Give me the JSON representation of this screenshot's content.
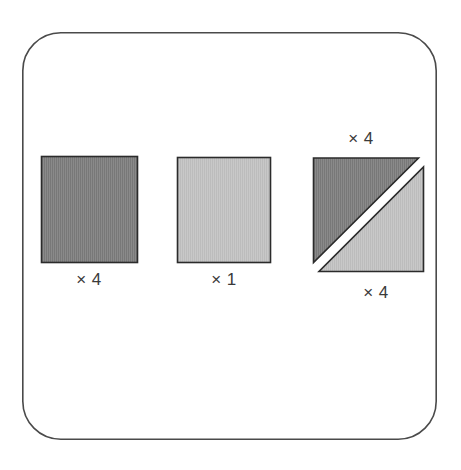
{
  "figure": {
    "canvas": {
      "width": 461,
      "height": 470,
      "background": "#ffffff"
    },
    "frame": {
      "name": "rounded-rectangle-frame",
      "x": 22,
      "y": 32,
      "width": 415,
      "height": 408,
      "corner_radius": 38,
      "stroke": "#4a4a4a",
      "stroke_width": 1.6,
      "fill": "#ffffff"
    },
    "palette": {
      "dark_fill": "#828282",
      "light_fill": "#c2c2c2",
      "shape_stroke": "#2b2b2b",
      "label_color": "#3a3a3a",
      "background": "#ffffff"
    },
    "shapes": [
      {
        "id": "dark-square",
        "type": "square",
        "tone": "dark",
        "fill": "#828282",
        "stroke": "#2b2b2b",
        "x": 41,
        "y": 156,
        "width": 97,
        "height": 107,
        "label": "× 4",
        "label_x": 89,
        "label_y": 285,
        "label_anchor": "middle"
      },
      {
        "id": "light-square",
        "type": "square",
        "tone": "light",
        "fill": "#c2c2c2",
        "stroke": "#2b2b2b",
        "x": 177,
        "y": 157,
        "width": 94,
        "height": 106,
        "label": "× 1",
        "label_x": 224,
        "label_y": 285,
        "label_anchor": "middle"
      },
      {
        "id": "dark-triangle",
        "type": "right-triangle",
        "tone": "dark",
        "orientation": "upper-left",
        "fill": "#828282",
        "stroke": "#2b2b2b",
        "points": "313,158 419,158 313,263",
        "label": "× 4",
        "label_x": 361,
        "label_y": 144,
        "label_anchor": "middle"
      },
      {
        "id": "light-triangle",
        "type": "right-triangle",
        "tone": "light",
        "orientation": "lower-right",
        "fill": "#c2c2c2",
        "stroke": "#2b2b2b",
        "points": "424,167 424,272 319,272",
        "label": "× 4",
        "label_x": 376,
        "label_y": 298,
        "label_anchor": "middle"
      }
    ],
    "labels": {
      "dark_square": "× 4",
      "light_square": "× 1",
      "dark_triangle": "× 4",
      "light_triangle": "× 4"
    }
  }
}
